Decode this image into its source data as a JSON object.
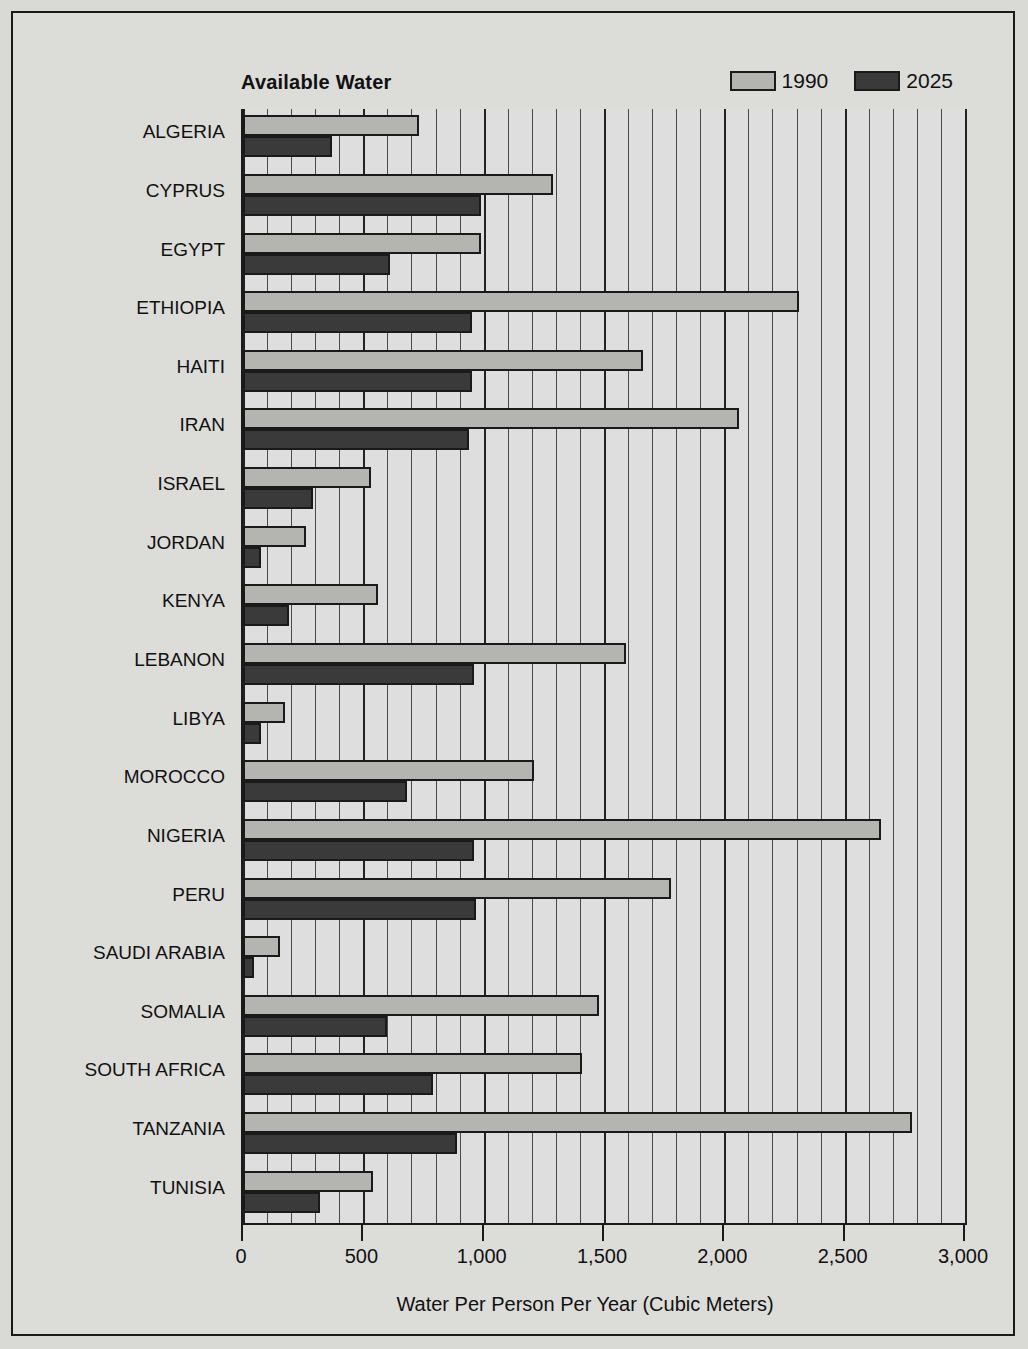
{
  "chart_data": {
    "type": "bar",
    "orientation": "horizontal",
    "title": "Available Water",
    "xlabel": "Water Per Person Per Year (Cubic Meters)",
    "ylabel": "",
    "xlim": [
      0,
      3000
    ],
    "xticks": [
      0,
      500,
      1000,
      1500,
      2000,
      2500,
      3000
    ],
    "xticklabels": [
      "0",
      "500",
      "1,000",
      "1,500",
      "2,000",
      "2,500",
      "3,000"
    ],
    "minor_gridline_step": 100,
    "grid": true,
    "legend_position": "top-right",
    "categories": [
      "ALGERIA",
      "CYPRUS",
      "EGYPT",
      "ETHIOPIA",
      "HAITI",
      "IRAN",
      "ISRAEL",
      "JORDAN",
      "KENYA",
      "LEBANON",
      "LIBYA",
      "MOROCCO",
      "NIGERIA",
      "PERU",
      "SAUDI ARABIA",
      "SOMALIA",
      "SOUTH AFRICA",
      "TANZANIA",
      "TUNISIA"
    ],
    "series": [
      {
        "name": "1990",
        "color": "#b4b4b0",
        "values": [
          730,
          1290,
          990,
          2310,
          1660,
          2060,
          530,
          260,
          560,
          1590,
          175,
          1210,
          2650,
          1780,
          155,
          1480,
          1410,
          2780,
          540
        ]
      },
      {
        "name": "2025",
        "color": "#3a3a3a",
        "values": [
          370,
          990,
          610,
          950,
          950,
          940,
          290,
          75,
          190,
          960,
          75,
          680,
          960,
          970,
          45,
          600,
          790,
          890,
          320
        ]
      }
    ]
  },
  "legend": {
    "items": [
      {
        "label": "1990",
        "swatch": "light-gray"
      },
      {
        "label": "2025",
        "swatch": "dark-gray"
      }
    ]
  }
}
